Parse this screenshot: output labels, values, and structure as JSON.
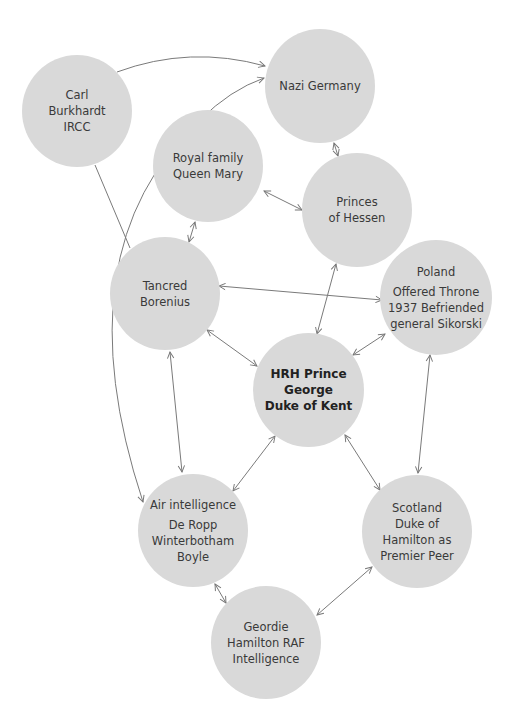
{
  "diagram": {
    "nodes": [
      {
        "id": "carl",
        "lines": [
          "Carl",
          "Burkhardt",
          "IRCC"
        ]
      },
      {
        "id": "nazi",
        "lines": [
          "Nazi Germany"
        ]
      },
      {
        "id": "royal",
        "lines": [
          "Royal family",
          "Queen Mary"
        ]
      },
      {
        "id": "hessen",
        "lines": [
          "Princes",
          "of Hessen"
        ]
      },
      {
        "id": "tancred",
        "lines": [
          "Tancred",
          "Borenius"
        ]
      },
      {
        "id": "poland",
        "title": "Poland",
        "lines": [
          "Offered Throne",
          "1937 Befriended",
          "general Sikorski"
        ]
      },
      {
        "id": "george",
        "lines": [
          "HRH Prince",
          "George",
          "Duke of Kent"
        ]
      },
      {
        "id": "air",
        "title": "Air intelligence",
        "lines": [
          "De Ropp",
          "Winterbotham",
          "Boyle"
        ]
      },
      {
        "id": "scotland",
        "lines": [
          "Scotland",
          "Duke of",
          "Hamilton as",
          "Premier Peer"
        ]
      },
      {
        "id": "geordie",
        "lines": [
          "Geordie",
          "Hamilton RAF",
          "Intelligence"
        ]
      }
    ],
    "edges": [
      {
        "from": "carl",
        "to": "nazi",
        "type": "directed"
      },
      {
        "from": "carl",
        "to": "tancred",
        "type": "line"
      },
      {
        "from": "air",
        "to": "nazi",
        "type": "directed"
      },
      {
        "from": "nazi",
        "to": "hessen",
        "type": "bidirectional"
      },
      {
        "from": "royal",
        "to": "hessen",
        "type": "bidirectional"
      },
      {
        "from": "royal",
        "to": "tancred",
        "type": "bidirectional"
      },
      {
        "from": "tancred",
        "to": "poland",
        "type": "bidirectional"
      },
      {
        "from": "tancred",
        "to": "george",
        "type": "bidirectional"
      },
      {
        "from": "tancred",
        "to": "air",
        "type": "bidirectional"
      },
      {
        "from": "hessen",
        "to": "george",
        "type": "bidirectional"
      },
      {
        "from": "poland",
        "to": "george",
        "type": "bidirectional"
      },
      {
        "from": "poland",
        "to": "scotland",
        "type": "bidirectional"
      },
      {
        "from": "george",
        "to": "air",
        "type": "bidirectional"
      },
      {
        "from": "george",
        "to": "scotland",
        "type": "bidirectional"
      },
      {
        "from": "air",
        "to": "geordie",
        "type": "bidirectional"
      },
      {
        "from": "geordie",
        "to": "scotland",
        "type": "bidirectional"
      }
    ],
    "colors": {
      "node_fill": "#d9d9d9",
      "edge": "#777777",
      "text": "#3a3a3a"
    }
  }
}
